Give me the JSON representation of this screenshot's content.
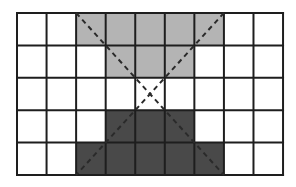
{
  "diagram": {
    "grid": {
      "rows": 5,
      "cols": 9,
      "origin_x": 17,
      "origin_y": 13,
      "cell_width": 29.56,
      "cell_height": 32.4,
      "line_color": "#1e1e1e",
      "line_width": 2
    },
    "fills": {
      "light": "#b4b4b4",
      "dark": "#494949",
      "empty": "#ffffff"
    },
    "cell_pattern": [
      [
        "empty",
        "empty",
        "light",
        "light",
        "light",
        "light",
        "light",
        "empty",
        "empty"
      ],
      [
        "empty",
        "empty",
        "empty",
        "light",
        "light",
        "light",
        "empty",
        "empty",
        "empty"
      ],
      [
        "empty",
        "empty",
        "empty",
        "empty",
        "empty",
        "empty",
        "empty",
        "empty",
        "empty"
      ],
      [
        "empty",
        "empty",
        "empty",
        "dark",
        "dark",
        "dark",
        "empty",
        "empty",
        "empty"
      ],
      [
        "empty",
        "empty",
        "dark",
        "dark",
        "dark",
        "dark",
        "dark",
        "empty",
        "empty"
      ]
    ],
    "diagonals": [
      {
        "name": "diagonal-top-left-to-bottom-right",
        "from": [
          2,
          0
        ],
        "to": [
          7,
          5
        ]
      },
      {
        "name": "diagonal-top-right-to-bottom-left",
        "from": [
          7,
          0
        ],
        "to": [
          2,
          5
        ]
      }
    ],
    "diagonal_style": {
      "color": "#2a2a2a",
      "width": 2,
      "dash": "5,4"
    }
  }
}
